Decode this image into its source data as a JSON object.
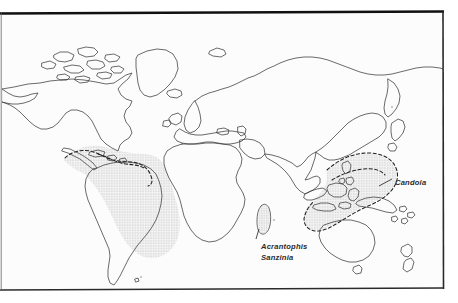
{
  "figure": {
    "kind": "distribution-map",
    "background_color": "#fcfcfd",
    "page_color": "#ffffff",
    "border_color": "#1a1a1a",
    "coastline_color": "#3a3a3a",
    "range_fill_color": "#e9e9e9",
    "range_dash_color": "#1f1f1f",
    "label_color": "#2b2b2b"
  },
  "labels": {
    "acrantophis": "Acrantophis",
    "sanzinia": "Sanzinia",
    "candoia": "Candoia"
  },
  "ranges": [
    {
      "name": "neotropical-range",
      "label": "",
      "style": "stippled-fill-dashed-edge",
      "region": "Central America, Caribbean and northern/central South America"
    },
    {
      "name": "madagascar-range",
      "label": "Acrantophis Sanzinia",
      "style": "stippled-fill",
      "region": "Madagascar"
    },
    {
      "name": "melanesian-range",
      "label": "Candoia",
      "style": "stippled-fill-dashed-edge",
      "region": "Eastern Indonesia, New Guinea, Solomon Islands and Melanesia"
    }
  ],
  "landmasses": [
    "North America",
    "Greenland",
    "Iceland",
    "South America",
    "Europe",
    "Africa",
    "Madagascar",
    "Asia",
    "Japan",
    "Philippines",
    "Indonesia",
    "New Guinea",
    "Australia",
    "Tasmania",
    "New Zealand"
  ]
}
